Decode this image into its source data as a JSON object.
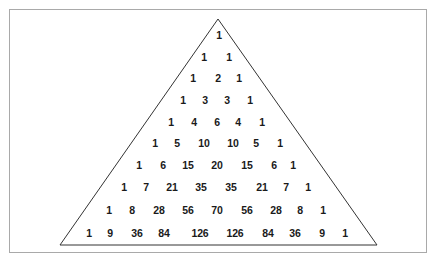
{
  "diagram": {
    "rows": [
      [
        1
      ],
      [
        1,
        1
      ],
      [
        1,
        2,
        1
      ],
      [
        1,
        3,
        3,
        1
      ],
      [
        1,
        4,
        6,
        4,
        1
      ],
      [
        1,
        5,
        10,
        10,
        5,
        1
      ],
      [
        1,
        6,
        15,
        20,
        15,
        6,
        1
      ],
      [
        1,
        7,
        21,
        35,
        35,
        21,
        7,
        1
      ],
      [
        1,
        8,
        28,
        56,
        70,
        56,
        28,
        8,
        1
      ],
      [
        1,
        9,
        36,
        84,
        126,
        126,
        84,
        36,
        9,
        1
      ]
    ],
    "row_y": [
      35,
      57,
      78,
      100,
      122,
      143,
      165,
      187,
      210,
      233
    ],
    "row_x": [
      [
        219
      ],
      [
        204,
        229
      ],
      [
        193,
        218,
        239
      ],
      [
        183,
        205,
        227,
        250
      ],
      [
        171,
        194,
        217,
        238,
        262
      ],
      [
        155,
        177,
        204,
        233,
        256,
        280
      ],
      [
        139,
        163,
        188,
        217,
        247,
        274,
        293
      ],
      [
        124,
        146,
        172,
        201,
        231,
        262,
        286,
        308
      ],
      [
        109,
        132,
        159,
        188,
        217,
        247,
        276,
        300,
        323
      ],
      [
        89,
        110,
        137,
        164,
        200,
        235,
        268,
        295,
        322,
        345
      ]
    ],
    "triangle": {
      "apex": [
        218,
        19
      ],
      "bottom_left": [
        60,
        245
      ],
      "bottom_right": [
        377,
        245
      ],
      "stroke": "#333333"
    },
    "frame_color": "#a9a9a9"
  }
}
